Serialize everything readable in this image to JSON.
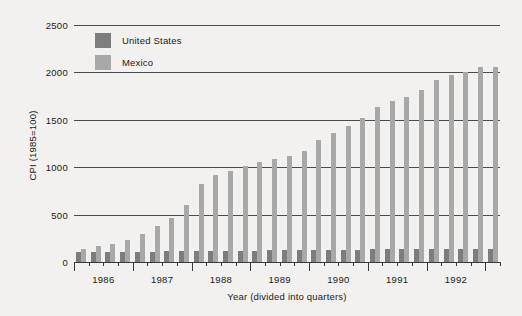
{
  "chart_data": {
    "type": "bar",
    "title": "",
    "xlabel": "Year (divided into quarters)",
    "ylabel": "CPI (1985=100)",
    "ylim": [
      0,
      2500
    ],
    "yticks": [
      0,
      500,
      1000,
      1500,
      2000,
      2500
    ],
    "ytick_labels": [
      "0",
      "500",
      "1000",
      "1500",
      "2000",
      "2500"
    ],
    "grid": true,
    "legend_position": "top-left",
    "year_labels": [
      "1986",
      "1987",
      "1988",
      "1989",
      "1990",
      "1991",
      "1992"
    ],
    "categories": [
      "1986 Q1",
      "1986 Q2",
      "1986 Q3",
      "1986 Q4",
      "1987 Q1",
      "1987 Q2",
      "1987 Q3",
      "1987 Q4",
      "1988 Q1",
      "1988 Q2",
      "1988 Q3",
      "1988 Q4",
      "1989 Q1",
      "1989 Q2",
      "1989 Q3",
      "1989 Q4",
      "1990 Q1",
      "1990 Q2",
      "1990 Q3",
      "1990 Q4",
      "1991 Q1",
      "1991 Q2",
      "1991 Q3",
      "1991 Q4",
      "1992 Q1",
      "1992 Q2",
      "1992 Q3",
      "1992 Q4",
      "1993 Q1"
    ],
    "series": [
      {
        "name": "United States",
        "color": "#7d7d7d",
        "values": [
          103,
          104,
          105,
          106,
          108,
          110,
          111,
          113,
          114,
          116,
          117,
          118,
          120,
          122,
          123,
          124,
          126,
          128,
          130,
          131,
          133,
          134,
          135,
          136,
          137,
          138,
          139,
          140,
          141
        ]
      },
      {
        "name": "Mexico",
        "color": "#a8a8a8",
        "values": [
          135,
          165,
          190,
          235,
          295,
          375,
          465,
          600,
          825,
          920,
          960,
          1010,
          1050,
          1090,
          1120,
          1175,
          1290,
          1365,
          1440,
          1520,
          1635,
          1695,
          1740,
          1815,
          1920,
          1975,
          2000,
          2060,
          2060
        ]
      }
    ]
  },
  "legend": {
    "items": [
      {
        "label": "United States",
        "color": "#7d7d7d"
      },
      {
        "label": "Mexico",
        "color": "#a8a8a8"
      }
    ]
  },
  "colors": {
    "background": "#f2f1ef",
    "axis": "#3a3a3a",
    "grid": "#4a4a4a",
    "text": "#1a1a1a",
    "us_bar": "#7d7d7d",
    "mx_bar": "#a8a8a8"
  }
}
